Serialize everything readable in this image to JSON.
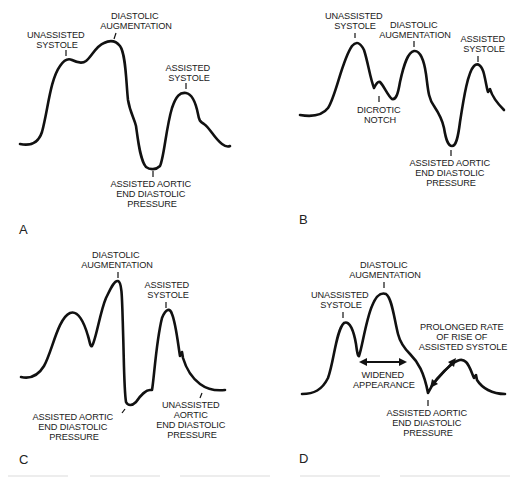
{
  "figure": {
    "panels": [
      {
        "id": "A",
        "letter": "A",
        "labels": {
          "unassisted_systole": [
            "UNASSISTED",
            "SYSTOLE"
          ],
          "diastolic_augmentation": [
            "DIASTOLIC",
            "AUGMENTATION"
          ],
          "assisted_systole": [
            "ASSISTED",
            "SYSTOLE"
          ],
          "assisted_aortic_edp": [
            "ASSISTED AORTIC",
            "END DIASTOLIC",
            "PRESSURE"
          ]
        }
      },
      {
        "id": "B",
        "letter": "B",
        "labels": {
          "unassisted_systole": [
            "UNASSISTED",
            "SYSTOLE"
          ],
          "diastolic_augmentation": [
            "DIASTOLIC",
            "AUGMENTATION"
          ],
          "assisted_systole": [
            "ASSISTED",
            "SYSTOLE"
          ],
          "dicrotic_notch": [
            "DICROTIC",
            "NOTCH"
          ],
          "assisted_aortic_edp": [
            "ASSISTED AORTIC",
            "END DIASTOLIC",
            "PRESSURE"
          ]
        }
      },
      {
        "id": "C",
        "letter": "C",
        "labels": {
          "diastolic_augmentation": [
            "DIASTOLIC",
            "AUGMENTATION"
          ],
          "assisted_systole": [
            "ASSISTED",
            "SYSTOLE"
          ],
          "assisted_aortic_edp": [
            "ASSISTED AORTIC",
            "END DIASTOLIC",
            "PRESSURE"
          ],
          "unassisted_aortic_edp": [
            "UNASSISTED",
            "AORTIC",
            "END DIASTOLIC",
            "PRESSURE"
          ]
        }
      },
      {
        "id": "D",
        "letter": "D",
        "labels": {
          "diastolic_augmentation": [
            "DIASTOLIC",
            "AUGMENTATION"
          ],
          "unassisted_systole": [
            "UNASSISTED",
            "SYSTOLE"
          ],
          "prolonged_rate": [
            "PROLONGED RATE",
            "OF RISE OF",
            "ASSISTED SYSTOLE"
          ],
          "widened_appearance": [
            "WIDENED",
            "APPEARANCE"
          ],
          "assisted_aortic_edp": [
            "ASSISTED AORTIC",
            "END DIASTOLIC",
            "PRESSURE"
          ]
        }
      }
    ],
    "caption": "",
    "stroke_color": "#111111",
    "background": "#ffffff"
  }
}
